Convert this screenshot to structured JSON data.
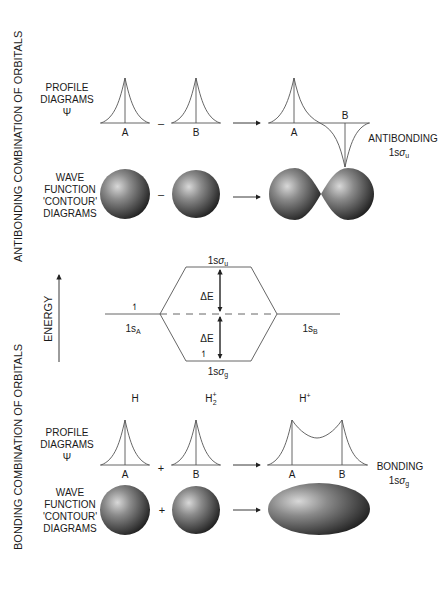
{
  "side_labels": {
    "antibonding": "ANTIBONDING COMBINATION OF ORBITALS",
    "bonding": "BONDING COMBINATION OF ORBITALS"
  },
  "row_labels": {
    "profile": [
      "PROFILE",
      "DIAGRAMS",
      "Ψ"
    ],
    "contour": [
      "WAVE",
      "FUNCTION",
      "'CONTOUR'",
      "DIAGRAMS"
    ]
  },
  "antibonding": {
    "operator": "–",
    "atom_a": "A",
    "atom_b": "B",
    "result_a": "A",
    "result_b": "B",
    "result_label": "ANTIBONDING",
    "orbital_prefix": "1s",
    "orbital_sigma": "σ",
    "orbital_sub": "u"
  },
  "energy": {
    "axis_label": "ENERGY",
    "upper_prefix": "1s",
    "upper_sigma": "σ",
    "upper_sub": "u",
    "lower_prefix": "1s",
    "lower_sigma": "σ",
    "lower_sub": "g",
    "left_prefix": "1s",
    "left_sub": "A",
    "right_prefix": "1s",
    "right_sub": "B",
    "delta_upper": "ΔE",
    "delta_lower": "ΔE",
    "electron": "↿"
  },
  "bonding": {
    "species_h": "H",
    "species_h2": "H",
    "species_h2_sub": "2",
    "species_h2_sup": "+",
    "species_hplus": "H",
    "species_hplus_sup": "+",
    "operator": "+",
    "atom_a": "A",
    "atom_b": "B",
    "result_a": "A",
    "result_b": "B",
    "result_label": "BONDING",
    "orbital_prefix": "1s",
    "orbital_sigma": "σ",
    "orbital_sub": "g"
  }
}
